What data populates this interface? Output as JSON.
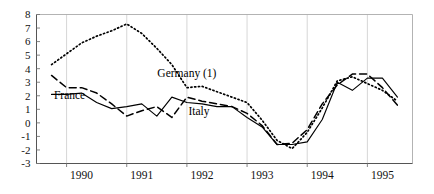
{
  "chart_data": {
    "type": "line",
    "title": "",
    "subtitle": "",
    "xlabel": "",
    "ylabel": "",
    "xlim": [
      1989.5,
      1995.75
    ],
    "ylim": [
      -3,
      8
    ],
    "y_ticks": [
      8,
      7,
      6,
      5,
      4,
      3,
      2,
      1,
      0,
      -1,
      -2,
      -3
    ],
    "x_ticks": [
      1990,
      1991,
      1992,
      1993,
      1994,
      1995
    ],
    "x_tick_labels": [
      "1990",
      "1991",
      "1992",
      "1993",
      "1994",
      "1995"
    ],
    "grid": "vertical-only",
    "legend_position": "inline-annotations",
    "annotations": [
      {
        "text": "Germany (1)",
        "x": 1992.0,
        "y": 3.35
      },
      {
        "text": "France",
        "x": 1990.05,
        "y": 1.75
      },
      {
        "text": "Italy",
        "x": 1992.2,
        "y": 0.55
      }
    ],
    "x": [
      1989.75,
      1990.0,
      1990.25,
      1990.5,
      1990.75,
      1991.0,
      1991.25,
      1991.5,
      1991.75,
      1992.0,
      1992.25,
      1992.5,
      1992.75,
      1993.0,
      1993.25,
      1993.5,
      1993.75,
      1994.0,
      1994.25,
      1994.5,
      1994.75,
      1995.0,
      1995.25,
      1995.5
    ],
    "series": [
      {
        "name": "Germany (1)",
        "style": "dotted",
        "values": [
          4.3,
          5.1,
          5.9,
          6.4,
          6.8,
          7.3,
          6.6,
          5.5,
          4.3,
          2.6,
          2.7,
          2.3,
          1.9,
          1.5,
          0.2,
          -1.3,
          -1.9,
          -0.7,
          1.1,
          3.1,
          3.4,
          2.9,
          2.4,
          1.6
        ]
      },
      {
        "name": "France",
        "style": "dashed",
        "values": [
          3.5,
          2.6,
          2.6,
          2.2,
          1.4,
          0.5,
          0.9,
          1.2,
          0.4,
          1.9,
          1.6,
          1.4,
          1.2,
          0.7,
          -0.2,
          -1.6,
          -1.5,
          -0.5,
          1.4,
          2.8,
          3.6,
          3.6,
          2.6,
          1.3
        ]
      },
      {
        "name": "Italy",
        "style": "solid",
        "values": [
          2.1,
          2.1,
          2.2,
          1.5,
          1.05,
          1.2,
          1.4,
          0.5,
          1.9,
          1.5,
          1.4,
          1.2,
          1.2,
          0.4,
          -0.3,
          -1.6,
          -1.6,
          -1.4,
          0.25,
          3.0,
          2.4,
          3.3,
          3.3,
          1.9
        ]
      }
    ]
  }
}
